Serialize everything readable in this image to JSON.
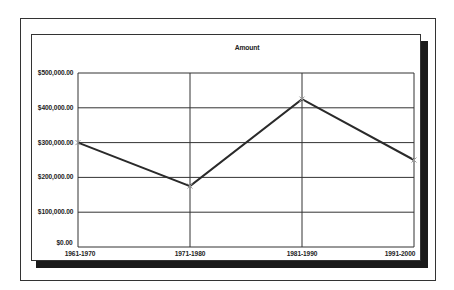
{
  "chart_data": {
    "type": "line",
    "title": "Amount",
    "xlabel": "",
    "ylabel": "",
    "categories": [
      "1961-1970",
      "1971-1980",
      "1981-1990",
      "1991-2000"
    ],
    "series": [
      {
        "name": "Amount",
        "values": [
          300000,
          175000,
          425000,
          250000
        ],
        "color": "#2a2a2a",
        "marker": "x"
      }
    ],
    "ylim": [
      0,
      500000
    ],
    "y_ticks": [
      0,
      100000,
      200000,
      300000,
      400000,
      500000
    ],
    "y_tick_labels": [
      "$0.00",
      "$100,000.00",
      "$200,000.00",
      "$300,000.00",
      "$400,000.00",
      "$500,000.00"
    ],
    "grid": true,
    "legend": "none"
  },
  "colors": {
    "line": "#2a2a2a",
    "grid": "#333333",
    "shadow": "#1a1a1a",
    "background": "#ffffff"
  }
}
